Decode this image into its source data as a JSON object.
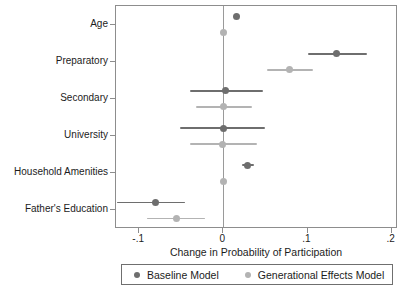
{
  "chart_data": {
    "type": "scatter",
    "title": "",
    "subtitle": "",
    "xlabel": "Change in Probability of Participation",
    "ylabel": "",
    "xlim": [
      -0.1275,
      0.2075
    ],
    "xticks": [
      -0.1,
      0,
      0.1,
      0.2
    ],
    "xticklabels": [
      "-.1",
      "0",
      ".1",
      ".2"
    ],
    "categories": [
      "Age",
      "Preparatory",
      "Secondary",
      "University",
      "Household Amenities",
      "Father's Education"
    ],
    "grid": false,
    "zero_reference_line": 0,
    "legend_position": "bottom",
    "orientation": "horizontal",
    "marker": "circle",
    "error_bars": "confidence-interval",
    "series": [
      {
        "name": "Baseline Model",
        "color": "#6e6e6e",
        "values": [
          0.016,
          0.135,
          0.002,
          0.0,
          0.029,
          -0.081
        ],
        "ci_low": [
          0.016,
          0.1,
          -0.04,
          -0.052,
          0.022,
          -0.126
        ],
        "ci_high": [
          0.016,
          0.171,
          0.047,
          0.05,
          0.037,
          -0.045
        ]
      },
      {
        "name": "Generational Effects Model",
        "color": "#b3b3b3",
        "values": [
          0.0,
          0.079,
          0.0,
          -0.001,
          0.0,
          -0.056
        ],
        "ci_low": [
          0.0,
          0.052,
          -0.032,
          -0.04,
          0.0,
          -0.091
        ],
        "ci_high": [
          0.0,
          0.107,
          0.034,
          0.04,
          0.0,
          -0.022
        ]
      }
    ]
  },
  "legend": {
    "items": [
      {
        "label": "Baseline Model",
        "color": "#6e6e6e"
      },
      {
        "label": "Generational Effects Model",
        "color": "#b3b3b3"
      }
    ]
  },
  "axis": {
    "x_title": "Change in Probability of Participation",
    "x_tick_labels": [
      "-.1",
      "0",
      ".1",
      ".2"
    ],
    "y_tick_labels": [
      "Age",
      "Preparatory",
      "Secondary",
      "University",
      "Household Amenities",
      "Father's Education"
    ]
  }
}
